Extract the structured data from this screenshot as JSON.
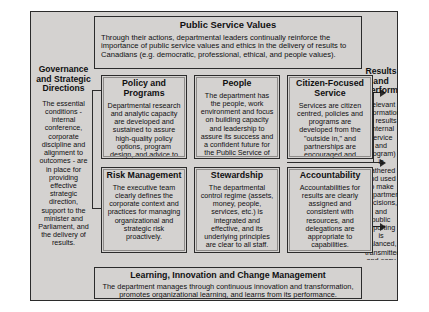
{
  "diagram": {
    "title_top": "Public Service Values",
    "values_band": {
      "title": "Public Service Values",
      "body": "Through their actions, departmental leaders continually reinforce the importance of public service values and ethics in the delivery of results to Canadians (e.g. democratic, professional, ethical, and people values)."
    },
    "left_column": {
      "title": "Governance and Strategic Directions",
      "body": "The essential conditions - internal conference, corporate discipline and alignment to outcomes - are in place for providing effective strategic direction, support to the minister and Parliament, and the delivery of results."
    },
    "right_column": {
      "title": "Results and Performance",
      "body": "Relevant information on results (internal service and program) is gathered and used to make departmental decisions, and public reporting is balanced, transmitted, and easy to understand."
    },
    "cells": [
      {
        "id": "policy",
        "title": "Policy and Programs",
        "body": "Departmental research and analytic capacity are developed and sustained to assure high-quality policy options, program design, and advice to ministries."
      },
      {
        "id": "people",
        "title": "People",
        "body": "The department has the people, work environment and focus on building capacity and leadership to assure its success and a confident future for the Public Service of Canada."
      },
      {
        "id": "citizen",
        "title": "Citizen-Focused Service",
        "body": "Services are citizen centred, policies and programs are developed from the \"outside in,\" and partnerships are encouraged and effectively managed."
      },
      {
        "id": "risk",
        "title": "Risk Management",
        "body": "The executive team clearly defines the corporate context and practices for managing organizational and strategic risk proactively."
      },
      {
        "id": "stewardship",
        "title": "Stewardship",
        "body": "The departmental control regime (assets, money, people, services, etc.) is integrated and effective, and its underlying principles are clear to all staff."
      },
      {
        "id": "accountability",
        "title": "Accountability",
        "body": "Accountabilities for results are clearly assigned and consistent with resources, and delegations are appropriate to capabilities."
      }
    ],
    "learning_band": {
      "title": "Learning, Innovation and Change Management",
      "body": "The department manages through continuous innovation and transformation, promotes organizational learning, and learns from its performance."
    },
    "colors": {
      "panel_fill": "#d4d2d0",
      "border": "#2b2b2b",
      "text": "#101010",
      "page_background": "#ffffff"
    }
  }
}
